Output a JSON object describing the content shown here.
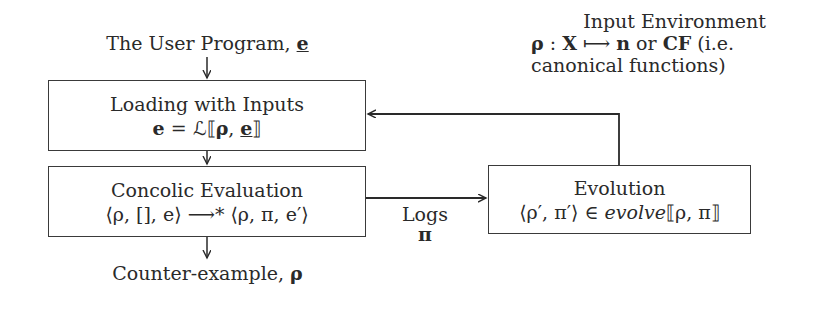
{
  "diagram": {
    "input_label": {
      "prefix": "The User Program, ",
      "symbol": "e"
    },
    "loading_box": {
      "title": "Loading with Inputs",
      "formula_lhs": "e",
      "formula_rest": " = ℒ⟦",
      "formula_rho": "ρ",
      "formula_comma": ", ",
      "formula_e": "e",
      "formula_close": "⟧"
    },
    "concolic_box": {
      "title": "Concolic Evaluation",
      "formula": "⟨ρ, [], e⟩ ⟶* ⟨ρ, π, e′⟩"
    },
    "evolution_box": {
      "title": "Evolution",
      "formula_left": "⟨ρ′, π′⟩ ∈ ",
      "formula_fn": "evolve",
      "formula_args": "⟦ρ, π⟧"
    },
    "logs_label": {
      "text": "Logs",
      "symbol": "π"
    },
    "output_label": {
      "prefix": "Counter-example, ",
      "symbol": "ρ"
    },
    "environment_note": {
      "title": "Input Environment",
      "line2_rho": "ρ",
      "line2_colon": " : ",
      "line2_X": "X",
      "line2_arrow": " ⟼ ",
      "line2_n": "n",
      "line2_or": " or ",
      "line2_CF": "CF",
      "line2_tail": " (i.e.",
      "line3": "canonical functions)"
    },
    "edges": [
      {
        "from": "input_label",
        "to": "loading_box"
      },
      {
        "from": "loading_box",
        "to": "concolic_box"
      },
      {
        "from": "concolic_box",
        "to": "evolution_box",
        "label": "Logs π"
      },
      {
        "from": "evolution_box",
        "to": "loading_box"
      },
      {
        "from": "concolic_box",
        "to": "output_label"
      }
    ]
  }
}
